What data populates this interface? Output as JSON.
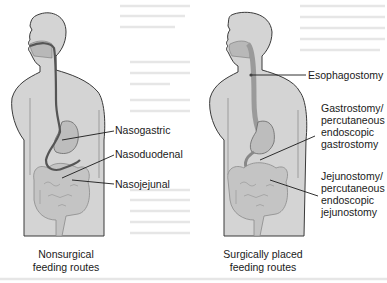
{
  "figure": {
    "panels": [
      {
        "id": "nonsurgical",
        "caption_line1": "Nonsurgical",
        "caption_line2": "feeding routes",
        "labels": [
          {
            "text": "Nasogastric"
          },
          {
            "text": "Nasoduodenal"
          },
          {
            "text": "Nasojejunal"
          }
        ]
      },
      {
        "id": "surgical",
        "caption_line1": "Surgically placed",
        "caption_line2": "feeding routes",
        "labels": [
          {
            "text": "Esophagostomy"
          },
          {
            "lines": [
              "Gastrostomy/",
              "percutaneous",
              "endoscopic",
              "gastrostomy"
            ]
          },
          {
            "lines": [
              "Jejunostomy/",
              "percutaneous",
              "endoscopic",
              "jejunostomy"
            ]
          }
        ]
      }
    ],
    "colors": {
      "body_fill": "#d4d4d4",
      "outline": "#3a3a3a",
      "tube": "#5a5a5a",
      "organ_fill": "#b8b8b8",
      "leader_line": "#1a1a1a",
      "text": "#1a1a1a"
    }
  }
}
